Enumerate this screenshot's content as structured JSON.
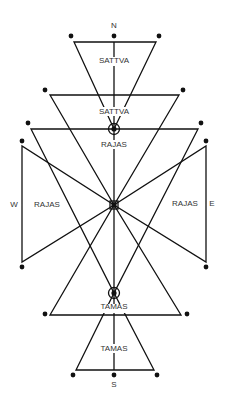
{
  "diagram": {
    "labels": {
      "north": "N",
      "south": "S",
      "west": "W",
      "east": "E",
      "sattva_top": "SATTVA",
      "sattva_mid": "SATTVA",
      "rajas_top": "RAJAS",
      "rajas_west": "RAJAS",
      "rajas_east": "RAJAS",
      "tamas_mid": "TAMAS",
      "tamas_bottom": "TAMAS"
    },
    "colors": {
      "line": "#111111",
      "text": "#333333",
      "background": "#ffffff"
    }
  }
}
